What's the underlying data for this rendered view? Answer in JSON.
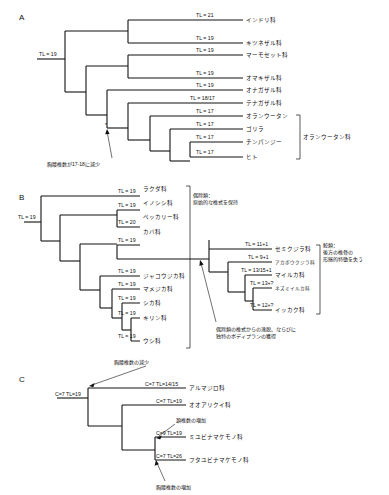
{
  "figure": {
    "panels": [
      {
        "letter": "A",
        "group_bracket_label": "オランウータン科",
        "annotation": "胸腰椎数が17-18に減少",
        "tips": [
          {
            "taxon": "インドリ科",
            "tl": "TL = 21"
          },
          {
            "taxon": "キツネザル科",
            "tl": "TL = 19"
          },
          {
            "taxon": "マーモセット科",
            "tl": "TL = 19"
          },
          {
            "taxon": "オマキザル科",
            "tl": "TL = 19"
          },
          {
            "taxon": "オナガザル科",
            "tl": "TL = 19"
          },
          {
            "taxon": "テナガザル科",
            "tl": "TL = 18/17"
          },
          {
            "taxon": "オランウータン",
            "tl": "TL = 17"
          },
          {
            "taxon": "ゴリラ",
            "tl": "TL = 17"
          },
          {
            "taxon": "チンパンジー",
            "tl": "TL = 17"
          },
          {
            "taxon": "ヒト",
            "tl": "TL = 17"
          }
        ],
        "root_label": "TL = 19"
      },
      {
        "letter": "B",
        "root_label": "TL = 19",
        "annotation_artiodactyl": "偶蹄類：\n原始的な椎式を保持",
        "annotation_artiodactyl_line1": "偶蹄類：",
        "annotation_artiodactyl_line2": "原始的な椎式を保持",
        "annotation_cetacean_line1": "鯨類：",
        "annotation_cetacean_line2": "後方の椎骨の",
        "annotation_cetacean_line3": "形態的特徴を失う",
        "annotation_transition_line1": "偶蹄類の椎式からの逸脱、ならびに",
        "annotation_transition_line2": "独特のボディプランの獲得",
        "tips_left": [
          {
            "taxon": "ラクダ科",
            "tl": "TL = 19"
          },
          {
            "taxon": "イノシシ科",
            "tl": "TL = 19"
          },
          {
            "taxon": "ペッカリー科",
            "tl": "TL = 20"
          },
          {
            "taxon": "カバ科",
            "tl": "TL = 19"
          },
          {
            "taxon": "ジャコウジカ科",
            "tl": "TL = 19"
          },
          {
            "taxon": "マメジカ科",
            "tl": "TL = 19"
          },
          {
            "taxon": "シカ科",
            "tl": "TL = 19"
          },
          {
            "taxon": "キリン科",
            "tl": "TL = 19"
          },
          {
            "taxon": "ウシ科",
            "tl": "TL = 19"
          }
        ],
        "tips_right": [
          {
            "taxon": "セミクジラ科",
            "tl": "TL = 11+1"
          },
          {
            "taxon": "アカボウクジラ科",
            "tl": "TL = 9+1"
          },
          {
            "taxon": "マイルカ科",
            "tl": "TL = 13/15+1"
          },
          {
            "taxon": "ネズミイルカ科",
            "tl": "TL = 13+?"
          },
          {
            "taxon": "イッカク科",
            "tl": "TL = 12+?"
          }
        ]
      },
      {
        "letter": "C",
        "root_label": "C=7 TL=19",
        "annotation_top": "胸腰椎数の減少",
        "annotation_mid": "頚椎数の増加",
        "annotation_bottom": "胸腰椎数の増加",
        "tips": [
          {
            "taxon": "アルマジロ科",
            "tl": "C=7 TL=14/15"
          },
          {
            "taxon": "オオアリクイ科",
            "tl": "C=7 TL=19"
          },
          {
            "taxon": "ミユビナマケモノ科",
            "tl": "C=9 TL=19"
          },
          {
            "taxon": "フタユビナマケモノ科",
            "tl": "C=7 TL=26"
          }
        ]
      }
    ]
  }
}
